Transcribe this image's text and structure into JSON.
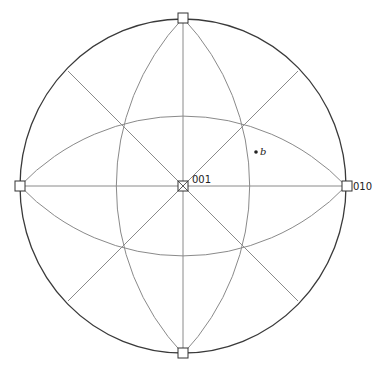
{
  "diagram": {
    "type": "stereographic-projection",
    "colors": {
      "primitive": "#3a3a3a",
      "lines": "#8a8a8a",
      "marker": "#333333"
    },
    "labels": {
      "center": "001",
      "right": "010",
      "point": "b"
    },
    "poles": [
      "top",
      "bottom",
      "left",
      "right",
      "center"
    ]
  }
}
